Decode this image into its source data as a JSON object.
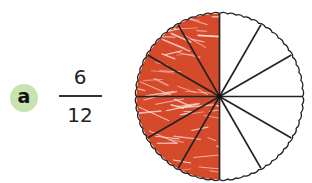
{
  "label": {
    "letter": "a",
    "badge_color": "#c8e2b0"
  },
  "fraction": {
    "numerator": "6",
    "denominator": "12"
  },
  "pie": {
    "total_sectors": 12,
    "shaded_sectors": 6,
    "shaded_side": "left",
    "shade_color": "#d64a2c",
    "outline_color": "#222222",
    "center": [
      219.5,
      96.5
    ],
    "radius": 83
  }
}
